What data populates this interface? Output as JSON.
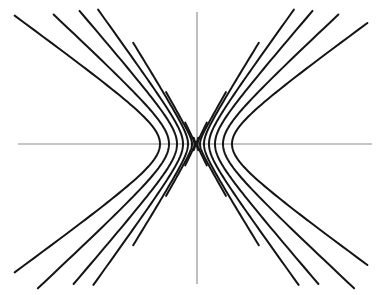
{
  "figure": {
    "caption": "",
    "background_color": "#ffffff",
    "curve_color": "#151515",
    "axis_color": "#8a8a8a",
    "curve_stroke_width": 2.0,
    "axis_stroke_width": 1.1,
    "width": 385,
    "height": 295
  },
  "chart_data": {
    "type": "line",
    "subtitle": "",
    "xlabel": "",
    "ylabel": "",
    "grid": false,
    "legend": "none",
    "axes": {
      "origin_px": {
        "x": 196,
        "y": 144
      },
      "x_axis_px": {
        "x1": 18,
        "y1": 144,
        "x2": 372,
        "y2": 144
      },
      "y_axis_px": {
        "x1": 197,
        "y1": 12,
        "x2": 197,
        "y2": 284
      },
      "xlim": [
        -178,
        176
      ],
      "ylim": [
        -140,
        132
      ],
      "units": "pixels from origin"
    },
    "series": [
      {
        "name": "hyperbola-1",
        "semi_axis_a": 36,
        "semi_axis_b": 26,
        "vertex_left_px": {
          "x": 160,
          "y": 144
        },
        "vertex_right_px": {
          "x": 232,
          "y": 144
        },
        "asymptote_slope": 0.722,
        "t_extent": 3.45
      },
      {
        "name": "hyperbola-2",
        "semi_axis_a": 27,
        "semi_axis_b": 25,
        "vertex_left_px": {
          "x": 169,
          "y": 144
        },
        "vertex_right_px": {
          "x": 223,
          "y": 144
        },
        "asymptote_slope": 0.926,
        "t_extent": 3.2
      },
      {
        "name": "hyperbola-3",
        "semi_axis_a": 19,
        "semi_axis_b": 22,
        "vertex_left_px": {
          "x": 177,
          "y": 144
        },
        "vertex_right_px": {
          "x": 215,
          "y": 144
        },
        "asymptote_slope": 1.158,
        "t_extent": 3.0
      },
      {
        "name": "hyperbola-4",
        "semi_axis_a": 13,
        "semi_axis_b": 18,
        "vertex_left_px": {
          "x": 183,
          "y": 144
        },
        "vertex_right_px": {
          "x": 209,
          "y": 144
        },
        "asymptote_slope": 1.385,
        "t_extent": 2.85
      },
      {
        "name": "hyperbola-5",
        "semi_axis_a": 8,
        "semi_axis_b": 13,
        "vertex_left_px": {
          "x": 188,
          "y": 144
        },
        "vertex_right_px": {
          "x": 204,
          "y": 144
        },
        "asymptote_slope": 1.625,
        "t_extent": 2.75
      },
      {
        "name": "hyperbola-6",
        "semi_axis_a": 4,
        "semi_axis_b": 7,
        "vertex_left_px": {
          "x": 192,
          "y": 144
        },
        "vertex_right_px": {
          "x": 200,
          "y": 144
        },
        "asymptote_slope": 1.75,
        "t_extent": 2.7
      },
      {
        "name": "hyperbola-7",
        "semi_axis_a": 1.6,
        "semi_axis_b": 3.2,
        "vertex_left_px": {
          "x": 194,
          "y": 144
        },
        "vertex_right_px": {
          "x": 198,
          "y": 144
        },
        "asymptote_slope": 2.0,
        "t_extent": 2.6
      },
      {
        "name": "hyperbola-8",
        "semi_axis_a": 0.5,
        "semi_axis_b": 1.4,
        "vertex_left_px": {
          "x": 195,
          "y": 144
        },
        "vertex_right_px": {
          "x": 197,
          "y": 144
        },
        "asymptote_slope": 2.8,
        "t_extent": 2.2
      }
    ]
  }
}
